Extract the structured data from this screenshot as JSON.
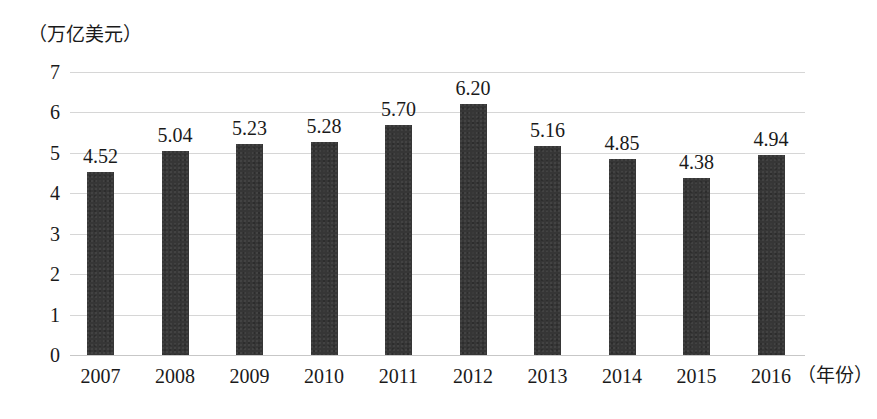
{
  "chart_data": {
    "type": "bar",
    "title": "",
    "subtitle": "",
    "ylabel": "（万亿美元）",
    "xlabel": "（年份）",
    "categories": [
      "2007",
      "2008",
      "2009",
      "2010",
      "2011",
      "2012",
      "2013",
      "2014",
      "2015",
      "2016"
    ],
    "values": [
      4.52,
      5.04,
      5.23,
      5.28,
      5.7,
      6.2,
      5.16,
      4.85,
      4.38,
      4.94
    ],
    "value_labels": [
      "4.52",
      "5.04",
      "5.23",
      "5.28",
      "5.70",
      "6.20",
      "5.16",
      "4.85",
      "4.38",
      "4.94"
    ],
    "ylim": [
      0,
      7
    ],
    "ytick_labels": [
      "0",
      "1",
      "2",
      "3",
      "4",
      "5",
      "6",
      "7"
    ],
    "ytick_values": [
      0,
      1,
      2,
      3,
      4,
      5,
      6,
      7
    ],
    "grid": true,
    "legend": null,
    "bar_color": "#363636",
    "gridline_color": "#c9c9c9",
    "background_color": "#ffffff",
    "text_color": "#1a1a1a"
  }
}
